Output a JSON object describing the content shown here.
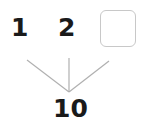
{
  "diagram": {
    "type": "number-bond",
    "parts": [
      {
        "label": "1"
      },
      {
        "label": "2"
      },
      {
        "label": "",
        "blank": true
      }
    ],
    "whole": {
      "label": "10"
    },
    "colors": {
      "text": "#1a1a1a",
      "line": "#b0b0b0",
      "box_border": "#c8c8c8"
    }
  }
}
